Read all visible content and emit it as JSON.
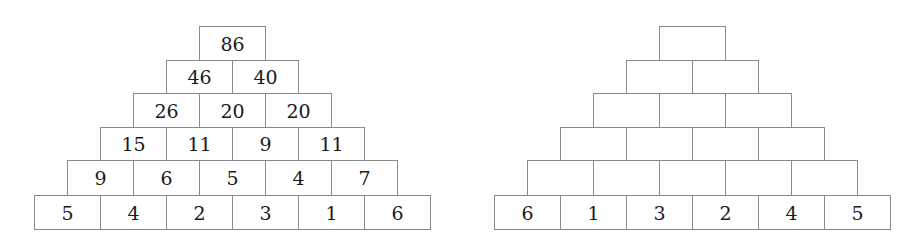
{
  "left_pyramid": {
    "rows": [
      [
        "86"
      ],
      [
        "46",
        "40"
      ],
      [
        "26",
        "20",
        "20"
      ],
      [
        "15",
        "11",
        "9",
        "11"
      ],
      [
        "9",
        "6",
        "5",
        "4",
        "7"
      ],
      [
        "5",
        "4",
        "2",
        "3",
        "1",
        "6"
      ]
    ]
  },
  "right_pyramid": {
    "rows": [
      [
        ""
      ],
      [
        "",
        ""
      ],
      [
        "",
        "",
        ""
      ],
      [
        "",
        "",
        "",
        ""
      ],
      [
        "",
        "",
        "",
        "",
        ""
      ],
      [
        "6",
        "1",
        "3",
        "2",
        "4",
        "5"
      ]
    ]
  },
  "colors": {
    "border": "#8a8a8a",
    "text": "#1a1a1a"
  }
}
